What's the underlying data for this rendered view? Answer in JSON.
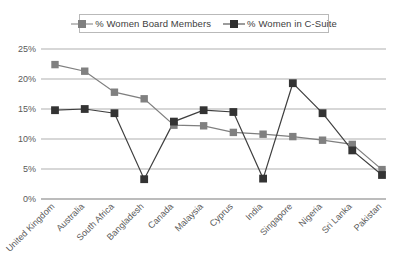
{
  "chart_data": {
    "type": "line",
    "title": "",
    "xlabel": "",
    "ylabel": "",
    "ylim": [
      0,
      25
    ],
    "y_ticks": [
      "0%",
      "5%",
      "10%",
      "15%",
      "20%",
      "25%"
    ],
    "grid": true,
    "legend_position": "top-center",
    "categories": [
      "United Kingdom",
      "Australia",
      "South Africa",
      "Bangladesh",
      "Canada",
      "Malaysia",
      "Cyprus",
      "India",
      "Singapore",
      "Nigeria",
      "Sri Lanka",
      "Pakistan"
    ],
    "series": [
      {
        "name": "% Women Board Members",
        "color": "#808080",
        "values": [
          22.4,
          21.3,
          17.8,
          16.7,
          12.3,
          12.2,
          11.1,
          10.8,
          10.4,
          9.8,
          9.1,
          4.9
        ]
      },
      {
        "name": "% Women in C-Suite",
        "color": "#333333",
        "values": [
          14.8,
          15.0,
          14.3,
          3.3,
          12.9,
          14.8,
          14.5,
          3.4,
          19.3,
          14.3,
          8.1,
          4.0
        ]
      }
    ]
  },
  "legend": {
    "entries": [
      {
        "label": "% Women Board Members"
      },
      {
        "label": "% Women in C-Suite"
      }
    ]
  },
  "colors": {
    "board": "#808080",
    "csuite": "#333333",
    "gridline": "#a6a6a6",
    "axis": "#7a7a7a",
    "text": "#5a5a5a",
    "background": "#ffffff"
  }
}
